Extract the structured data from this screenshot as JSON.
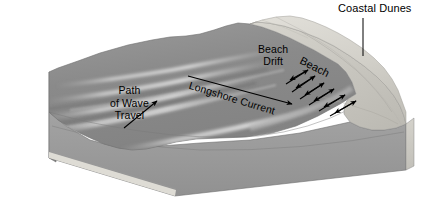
{
  "diagram": {
    "type": "block-diagram",
    "width": 442,
    "height": 203,
    "background_color": "#ffffff"
  },
  "labels": {
    "coastal_dunes": "Coastal Dunes",
    "beach_drift_line1": "Beach",
    "beach_drift_line2": "Drift",
    "beach": "Beach",
    "longshore_current": "Longshore Current",
    "path_of_wave_line1": "Path",
    "path_of_wave_line2": "of Wave",
    "path_of_wave_line3": "Travel"
  },
  "colors": {
    "water_surface": "#8d8d8d",
    "water_surface_dark": "#7b7b7b",
    "water_front_face": "#9a9a9a",
    "water_left_face": "#8a8a8a",
    "sand_bottom_strip": "#d8d6cf",
    "beach_sand": "#c9c7c0",
    "dune_light": "#dddbd5",
    "dune_mid": "#cbc9c2",
    "wave_crest": "#c2c2c2",
    "outline": "#6f6f6f",
    "arrow": "#000000",
    "text": "#000000"
  },
  "features": [
    {
      "name": "water-body",
      "description": "Ocean water surface with diagonal wave crests approaching shore"
    },
    {
      "name": "beach",
      "description": "Light sand beach strip along the shoreline"
    },
    {
      "name": "coastal-dunes",
      "description": "Raised dune ridge behind the beach"
    },
    {
      "name": "longshore-current-arrow",
      "description": "Long arrow running down-right parallel to shore"
    },
    {
      "name": "beach-drift-zigzag",
      "description": "Zigzag swash and backwash arrows along the beach"
    },
    {
      "name": "wave-travel-arrow",
      "description": "Arrow pointing up-right indicating direction of wave travel"
    }
  ]
}
